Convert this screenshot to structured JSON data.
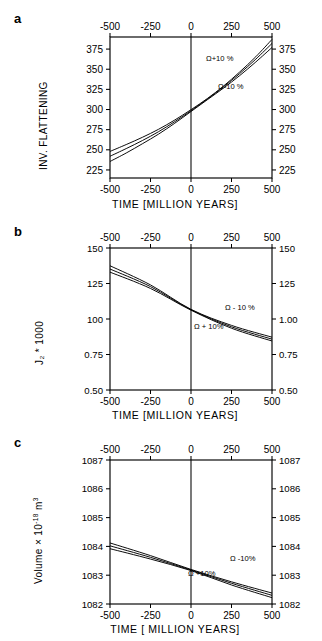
{
  "figure": {
    "panels": [
      {
        "letter": "a",
        "ylabel": "INV. FLATTENING",
        "xlabel": "TIME [MILLION YEARS]",
        "ann_upper": "Ω+10 %",
        "ann_lower": "Ω-10 %",
        "yticks": [
          "225",
          "250",
          "275",
          "300",
          "325",
          "350",
          "375"
        ],
        "xticks": [
          "-500",
          "-250",
          "0",
          "250",
          "500"
        ]
      },
      {
        "letter": "b",
        "ylabel": "J₂ * 1000",
        "xlabel": "TIME [MILLION YEARS]",
        "ann_upper": "Ω - 10 %",
        "ann_lower": "Ω + 10%",
        "yticks_left": [
          "0.50",
          "0.75",
          "100",
          "125",
          "150"
        ],
        "yticks_right": [
          "0.50",
          "0.75",
          "1.00",
          "125",
          "150"
        ],
        "xticks": [
          "-500",
          "-250",
          "0",
          "250",
          "500"
        ]
      },
      {
        "letter": "c",
        "ylabel_pre": "Volume × 10",
        "ylabel_sup1": "-18",
        "ylabel_mid": " m",
        "ylabel_sup2": "3",
        "xlabel": "TIME [ MILLION YEARS]",
        "ann_upper": "Ω -10%",
        "ann_lower": "Ω +10%",
        "yticks": [
          "1082",
          "1083",
          "1084",
          "1085",
          "1086",
          "1087"
        ],
        "xticks": [
          "-500",
          "-250",
          "0",
          "250",
          "500"
        ]
      }
    ]
  },
  "chart_data": [
    {
      "type": "line",
      "title": "a",
      "xlabel": "TIME [MILLION YEARS]",
      "ylabel": "INV. FLATTENING",
      "xlim": [
        -500,
        500
      ],
      "ylim": [
        215,
        390
      ],
      "xticks": [
        -500,
        -250,
        0,
        250,
        500
      ],
      "yticks": [
        225,
        250,
        275,
        300,
        325,
        350,
        375
      ],
      "grid": false,
      "legend": "inline-annotations",
      "annotations": [
        "Ω+10 %",
        "Ω-10 %"
      ],
      "x": [
        -500,
        -400,
        -300,
        -200,
        -100,
        0,
        100,
        200,
        300,
        400,
        500
      ],
      "series": [
        {
          "name": "Ω+10 %",
          "values": [
            248.0,
            256.5,
            265.5,
            275.5,
            287.0,
            299.8,
            313.5,
            329.0,
            346.5,
            365.5,
            387.0
          ]
        },
        {
          "name": "nominal Ω",
          "values": [
            242.0,
            251.5,
            261.5,
            272.5,
            285.0,
            298.5,
            312.8,
            328.0,
            344.5,
            362.5,
            382.0
          ]
        },
        {
          "name": "Ω-10 %",
          "values": [
            235.5,
            246.0,
            257.5,
            269.5,
            283.0,
            297.5,
            312.0,
            326.5,
            342.0,
            359.0,
            377.0
          ]
        }
      ]
    },
    {
      "type": "line",
      "title": "b",
      "xlabel": "TIME [MILLION YEARS]",
      "ylabel": "J2 * 1000",
      "xlim": [
        -500,
        500
      ],
      "ylim": [
        0.5,
        1.5
      ],
      "xticks": [
        -500,
        -250,
        0,
        250,
        500
      ],
      "yticks": [
        0.5,
        0.75,
        1.0,
        1.25,
        1.5
      ],
      "grid": false,
      "legend": "inline-annotations",
      "annotations": [
        "Ω - 10 %",
        "Ω + 10%"
      ],
      "x": [
        -500,
        -250,
        0,
        250,
        500
      ],
      "series": [
        {
          "name": "Ω - 10 %",
          "values": [
            1.375,
            1.24,
            1.068,
            0.955,
            0.872
          ]
        },
        {
          "name": "nominal Ω",
          "values": [
            1.352,
            1.228,
            1.065,
            0.945,
            0.858
          ]
        },
        {
          "name": "Ω + 10%",
          "values": [
            1.33,
            1.215,
            1.062,
            0.935,
            0.845
          ]
        }
      ]
    },
    {
      "type": "line",
      "title": "c",
      "xlabel": "TIME [ MILLION YEARS]",
      "ylabel": "Volume × 10^-18 m^3",
      "xlim": [
        -500,
        500
      ],
      "ylim": [
        1082,
        1087
      ],
      "xticks": [
        -500,
        -250,
        0,
        250,
        500
      ],
      "yticks": [
        1082,
        1083,
        1084,
        1085,
        1086,
        1087
      ],
      "grid": false,
      "legend": "inline-annotations",
      "annotations": [
        "Ω -10%",
        "Ω +10%"
      ],
      "x": [
        -500,
        -250,
        0,
        250,
        500
      ],
      "series": [
        {
          "name": "Ω -10%",
          "values": [
            1084.12,
            1083.68,
            1083.2,
            1082.77,
            1082.38
          ]
        },
        {
          "name": "nominal Ω",
          "values": [
            1084.02,
            1083.62,
            1083.18,
            1082.72,
            1082.3
          ]
        },
        {
          "name": "Ω +10%",
          "values": [
            1083.92,
            1083.56,
            1083.16,
            1082.66,
            1082.22
          ]
        }
      ]
    }
  ]
}
